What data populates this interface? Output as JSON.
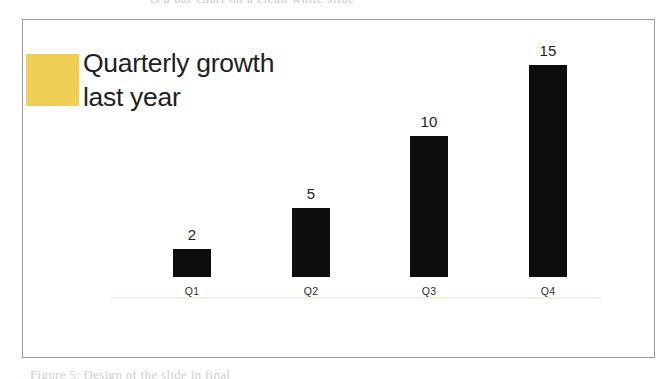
{
  "page": {
    "background_color": "#ffffff",
    "width": 670,
    "height": 379
  },
  "slide": {
    "frame_border_color": "#9a9a9a",
    "background_color": "#ffffff",
    "accent_color": "#efd055",
    "title_text": "Quarterly growth\nlast year",
    "title_line_1": "Quarterly growth",
    "title_line_2": "last year",
    "title_color": "#231f20"
  },
  "scan_artifacts": {
    "top_clipped_text": "is a bar chart on a clean white slide",
    "bottom_clipped_caption": "Figure 5: Design of the slide in final"
  },
  "chart_data": {
    "type": "bar",
    "title": "Quarterly growth last year",
    "xlabel": "",
    "ylabel": "",
    "categories": [
      "Q1",
      "Q2",
      "Q3",
      "Q4"
    ],
    "values": [
      2,
      5,
      10,
      15
    ],
    "value_labels": [
      "2",
      "5",
      "10",
      "15"
    ],
    "ylim": [
      0,
      15
    ],
    "grid": false,
    "legend": "none",
    "bar_color": "#0d0d0d",
    "baseline_color": "#f3f0e0",
    "label_color": "#2b2b2b",
    "value_label_color": "#231f20",
    "pixels_per_unit": 14.1,
    "bars": [
      {
        "category": "Q1",
        "value": 2,
        "value_label": "2",
        "left": 172,
        "width": 38,
        "height_px": 28
      },
      {
        "category": "Q2",
        "value": 5,
        "value_label": "5",
        "left": 291,
        "width": 38,
        "height_px": 69
      },
      {
        "category": "Q3",
        "value": 10,
        "value_label": "10",
        "left": 409,
        "width": 38,
        "height_px": 141
      },
      {
        "category": "Q4",
        "value": 15,
        "value_label": "15",
        "left": 528,
        "width": 38,
        "height_px": 212
      }
    ]
  }
}
